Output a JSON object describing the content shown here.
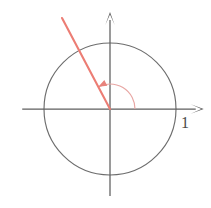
{
  "figure": {
    "background_color": "#ffffff",
    "width": 211,
    "height": 208
  },
  "labels": {
    "unit_label": "1"
  },
  "colors": {
    "axis": "#5e5e5e",
    "circle": "#6d6d6d",
    "terminal_ray": "#ec7d74",
    "angle_arc": "#e8a6a3",
    "label_text": "#4a4a4a"
  },
  "chart_data": {
    "type": "scatter",
    "xlabel": "",
    "ylabel": "",
    "xlim": [
      -1.35,
      1.42
    ],
    "ylim": [
      -1.32,
      1.47
    ],
    "grid": false,
    "legend": null,
    "origin_px": [
      110,
      109
    ],
    "unit_radius_px": 66,
    "elements": [
      {
        "name": "unit-circle",
        "kind": "circle",
        "center": [
          0,
          0
        ],
        "radius": 1,
        "stroke": "#6d6d6d"
      },
      {
        "name": "x-axis",
        "kind": "arrow-axis",
        "from": [
          -1.33,
          0
        ],
        "to": [
          1.42,
          0
        ],
        "arrow_at": "end"
      },
      {
        "name": "y-axis",
        "kind": "arrow-axis",
        "from": [
          0,
          -1.32
        ],
        "to": [
          0,
          1.47
        ],
        "arrow_at": "end"
      },
      {
        "name": "terminal-ray",
        "kind": "ray",
        "from": [
          0,
          0
        ],
        "to": [
          -0.727,
          1.379
        ],
        "length": 1.56,
        "angle_degrees": 117.8,
        "stroke": "#ec7d74"
      },
      {
        "name": "angle-arc",
        "kind": "arc",
        "center": [
          0,
          0
        ],
        "radius": 0.379,
        "start_angle_degrees": 0,
        "end_angle_degrees": 117.8,
        "direction": "counterclockwise",
        "arrow_at": "end",
        "stroke": "#e8a6a3"
      }
    ],
    "annotations": [
      {
        "name": "unit-label",
        "text": "1",
        "x": 1.1,
        "y": -0.17,
        "px": [
          181,
          128
        ]
      }
    ]
  }
}
